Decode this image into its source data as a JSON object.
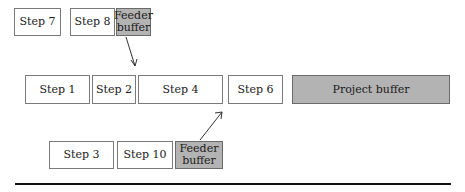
{
  "diagram": {
    "type": "critical-chain-schedule",
    "rows": [
      {
        "name": "feeder-chain-top",
        "boxes": [
          {
            "label": "Step 7",
            "kind": "task"
          },
          {
            "label": "Step 8",
            "kind": "task"
          },
          {
            "label": "Feeder buffer",
            "kind": "buffer"
          }
        ]
      },
      {
        "name": "critical-chain",
        "boxes": [
          {
            "label": "Step 1",
            "kind": "task"
          },
          {
            "label": "Step 2",
            "kind": "task"
          },
          {
            "label": "Step 4",
            "kind": "task"
          },
          {
            "label": "Step 6",
            "kind": "task"
          },
          {
            "label": "Project buffer",
            "kind": "buffer"
          }
        ]
      },
      {
        "name": "feeder-chain-bottom",
        "boxes": [
          {
            "label": "Step 3",
            "kind": "task"
          },
          {
            "label": "Step 10",
            "kind": "task"
          },
          {
            "label": "Feeder buffer",
            "kind": "buffer"
          }
        ]
      }
    ],
    "arrows": [
      {
        "from": "top feeder buffer",
        "to": "Step 4 (critical chain)"
      },
      {
        "from": "bottom feeder buffer",
        "to": "Step 6 (critical chain)"
      }
    ],
    "colors": {
      "task_fill": "#ffffff",
      "buffer_fill": "#b3b3b3",
      "border": "#7a7a7a",
      "rule": "#111111"
    }
  }
}
